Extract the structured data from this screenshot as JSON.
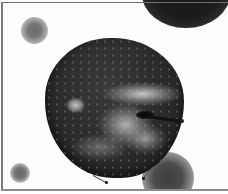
{
  "image": {
    "subject": "apple",
    "description": "Grayscale photo of an apple with blurred spheres in the background, inside a thin gray frame",
    "tone": "grayscale",
    "colors": {
      "background": "#fdfdfd",
      "frame": "#6e6e6e",
      "apple_dark": "#262626",
      "apple_highlight": "#d7d7d7",
      "sphere_dark": "#151515",
      "sphere_mid": "#4c4c4c"
    }
  },
  "elements": {
    "frame": "thin-frame",
    "spheres": [
      "top-right-dark-sphere",
      "top-left-blur-sphere",
      "bottom-left-blur-sphere",
      "bottom-right-blur-sphere"
    ],
    "apple_parts": [
      "body",
      "light-patch",
      "streak-band",
      "stem-cavity",
      "stem"
    ],
    "path_handles": [
      {
        "name": "anchor-handle-left"
      },
      {
        "name": "anchor-handle-right"
      }
    ]
  }
}
